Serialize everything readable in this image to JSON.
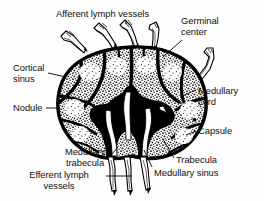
{
  "figure": {
    "colors": {
      "ink": "#000000",
      "background": "#fdfdfd",
      "cortex_fill": "#ffffff",
      "medulla_fill": "#000000",
      "stipple": "#111111"
    }
  },
  "labels": {
    "afferent_lymph_vessels": "Afferent lymph vessels",
    "germinal_center_line1": "Germinal",
    "germinal_center_line2": "center",
    "cortical_sinus_line1": "Cortical",
    "cortical_sinus_line2": "sinus",
    "nodule": "Nodule",
    "medullary_cord_line1": "Medullary",
    "medullary_cord_line2": "cord",
    "capsule": "Capsule",
    "trabecula": "Trabecula",
    "medullary_sinus": "Medullary sinus",
    "medullary_trabecula_line1": "Medullary",
    "medullary_trabecula_line2": "trabecula",
    "efferent_lymph_vessels_line1": "Efferent lymph",
    "efferent_lymph_vessels_line2": "vessels"
  }
}
